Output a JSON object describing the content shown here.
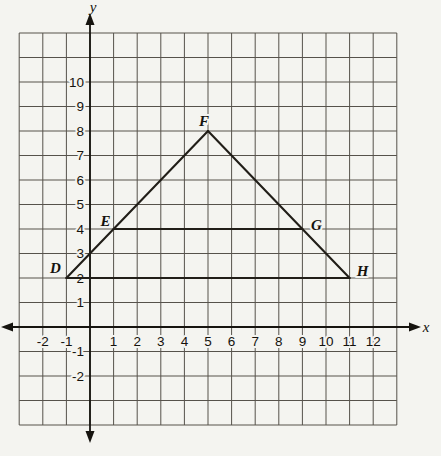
{
  "chart_data": {
    "type": "line",
    "title": "",
    "xlabel": "x",
    "ylabel": "y",
    "xlim": [
      -3,
      13
    ],
    "ylim": [
      -4,
      12
    ],
    "grid": true,
    "x_ticks": [
      -2,
      -1,
      1,
      2,
      3,
      4,
      5,
      6,
      7,
      8,
      9,
      10,
      11,
      12
    ],
    "y_ticks": [
      10,
      9,
      8,
      7,
      6,
      5,
      4,
      3,
      2,
      1,
      -1,
      -2
    ],
    "points": [
      {
        "label": "D",
        "x": -1,
        "y": 2
      },
      {
        "label": "E",
        "x": 1,
        "y": 4
      },
      {
        "label": "F",
        "x": 5,
        "y": 8
      },
      {
        "label": "G",
        "x": 9,
        "y": 4
      },
      {
        "label": "H",
        "x": 11,
        "y": 2
      }
    ],
    "segments": [
      [
        "D",
        "F"
      ],
      [
        "F",
        "H"
      ],
      [
        "H",
        "D"
      ],
      [
        "E",
        "G"
      ]
    ],
    "colors": {
      "paper": "#f4f4f0",
      "grid": "#56524b",
      "axis": "#16140f",
      "shape": "#211e18",
      "text": "#14120d"
    }
  }
}
